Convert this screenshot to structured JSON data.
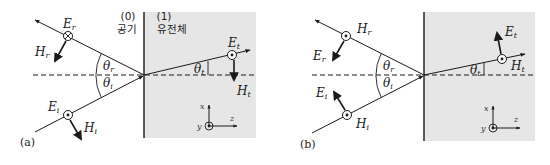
{
  "figure": {
    "colors": {
      "medium_fill": "#e6e6e6",
      "line": "#1a1a1a",
      "interface": "#333333"
    },
    "panels": [
      {
        "id": "a",
        "caption": "(a)",
        "region0": {
          "index": "(0)",
          "name": "공기"
        },
        "region1": {
          "index": "(1)",
          "name": "유전체"
        },
        "reflected": {
          "E_main": "E",
          "E_sub": "r",
          "H_main": "H",
          "H_sub": "r",
          "E_symbol": "cross-in-circle"
        },
        "incident": {
          "E_main": "E",
          "E_sub": "i",
          "H_main": "H",
          "H_sub": "i",
          "E_symbol": "dot-in-circle"
        },
        "transmitted": {
          "E_main": "E",
          "E_sub": "t",
          "H_main": "H",
          "H_sub": "t",
          "E_symbol": "dot-in-circle"
        },
        "angles": {
          "reflect_main": "θ",
          "reflect_sub": "r",
          "incident_main": "θ",
          "incident_sub": "i",
          "trans_main": "θ",
          "trans_sub": "t"
        },
        "axes": {
          "x": "x",
          "y": "y",
          "z": "z"
        }
      },
      {
        "id": "b",
        "caption": "(b)",
        "reflected": {
          "H_main": "H",
          "H_sub": "r",
          "E_main": "E",
          "E_sub": "r",
          "H_symbol": "dot-in-circle"
        },
        "incident": {
          "H_main": "H",
          "H_sub": "i",
          "E_main": "E",
          "E_sub": "i",
          "H_symbol": "dot-in-circle"
        },
        "transmitted": {
          "H_main": "H",
          "H_sub": "t",
          "E_main": "E",
          "E_sub": "t",
          "H_symbol": "dot-in-circle"
        },
        "angles": {
          "reflect_main": "θ",
          "reflect_sub": "r",
          "incident_main": "θ",
          "incident_sub": "i",
          "trans_main": "θ",
          "trans_sub": "t"
        },
        "axes": {
          "x": "x",
          "y": "y",
          "z": "z"
        }
      }
    ]
  }
}
